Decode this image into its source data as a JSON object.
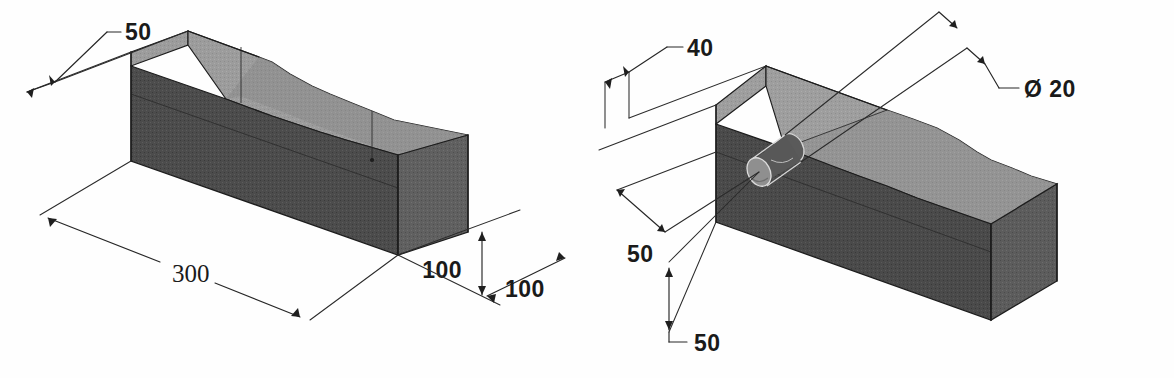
{
  "sheet": {
    "title": "Isometric pictorial drawings of two machined blocks",
    "background_color": "#fefefe",
    "line_color": "#1d1d1d",
    "top_face_color": "#9a9a9a",
    "front_face_color": "#4a4a4a",
    "side_face_color": "#5e5e5e"
  },
  "figures": [
    {
      "id": "left",
      "name": "ramped-block-with-dimensions",
      "description": "Rectangular block with a sloping ramp cut on the top right portion",
      "dimensions": [
        {
          "name": "width-50",
          "label": "50",
          "value": 50,
          "unit": "mm",
          "kind": "leader"
        },
        {
          "name": "length-300",
          "label": "300",
          "value": 300,
          "unit": "mm",
          "kind": "linear"
        },
        {
          "name": "height-100",
          "label": "100",
          "value": 100,
          "unit": "mm",
          "kind": "vertical"
        },
        {
          "name": "depth-100",
          "label": "100",
          "value": 100,
          "unit": "mm",
          "kind": "linear"
        }
      ]
    },
    {
      "id": "right",
      "name": "ramped-block-with-through-hole",
      "description": "Rectangular block with sloping ramp on top and a through hole on the left end face",
      "dimensions": [
        {
          "name": "width-40",
          "label": "40",
          "value": 40,
          "unit": "mm",
          "kind": "leader"
        },
        {
          "name": "hole-diameter-20",
          "label": "Ø 20",
          "value": 20,
          "unit": "mm",
          "kind": "diameter"
        },
        {
          "name": "offset-50-upper",
          "label": "50",
          "value": 50,
          "unit": "mm",
          "kind": "linear"
        },
        {
          "name": "offset-50-lower",
          "label": "50",
          "value": 50,
          "unit": "mm",
          "kind": "vertical"
        }
      ]
    }
  ],
  "labels": {
    "left_50": "50",
    "left_300": "300",
    "left_100_height": "100",
    "left_100_depth": "100",
    "right_40": "40",
    "right_dia_20": "Ø 20",
    "right_50_upper": "50",
    "right_50_lower": "50"
  }
}
